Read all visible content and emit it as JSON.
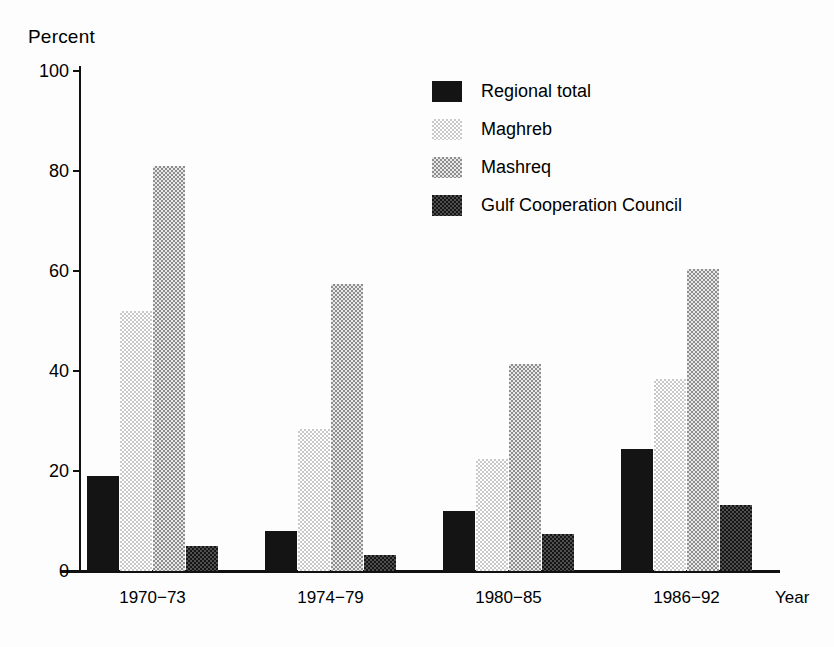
{
  "chart_data": {
    "type": "bar",
    "title": "",
    "xlabel": "Year",
    "ylabel": "Percent",
    "ylim": [
      0,
      100
    ],
    "yticks": [
      0,
      20,
      40,
      60,
      80,
      100
    ],
    "grid": false,
    "legend_position": "top-right",
    "categories": [
      "1970−73",
      "1974−79",
      "1980−85",
      "1986−92"
    ],
    "series": [
      {
        "name": "Regional total",
        "pattern": "solid",
        "values": [
          19,
          8,
          12,
          24.5
        ]
      },
      {
        "name": "Maghreb",
        "pattern": "light",
        "values": [
          52,
          28.5,
          22.5,
          38.5
        ]
      },
      {
        "name": "Mashreq",
        "pattern": "medium",
        "values": [
          81,
          57.5,
          41.5,
          60.5
        ]
      },
      {
        "name": "Gulf Cooperation Council",
        "pattern": "dark",
        "values": [
          5,
          3.2,
          7.5,
          13.2
        ]
      }
    ]
  },
  "axes": {
    "y_title": "Percent",
    "x_title": "Year",
    "y_tick_labels": [
      "100",
      "80",
      "60",
      "40",
      "20",
      "0"
    ],
    "x_tick_labels": [
      "1970−73",
      "1974−79",
      "1980−85",
      "1986−92"
    ]
  },
  "legend": {
    "items": [
      {
        "label": "Regional total",
        "pattern": "solid"
      },
      {
        "label": "Maghreb",
        "pattern": "light"
      },
      {
        "label": "Mashreq",
        "pattern": "medium"
      },
      {
        "label": "Gulf Cooperation Council",
        "pattern": "dark"
      }
    ]
  },
  "colors": {
    "ink": "#141414",
    "light_fill": "#c9c9c9",
    "medium_fill": "#8e8e8e",
    "dark_fill": "#2b2b2b",
    "background": "#ffffff"
  }
}
